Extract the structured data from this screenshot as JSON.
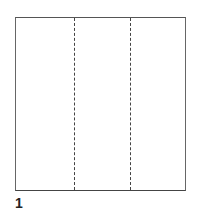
{
  "diagram": {
    "step_label": "1",
    "shape": "square",
    "fold_lines": [
      {
        "style": "dashed",
        "position": "one-third"
      },
      {
        "style": "dashed",
        "position": "two-thirds"
      }
    ],
    "colors": {
      "outline": "#555555",
      "fold": "#444444",
      "background": "#ffffff"
    }
  }
}
